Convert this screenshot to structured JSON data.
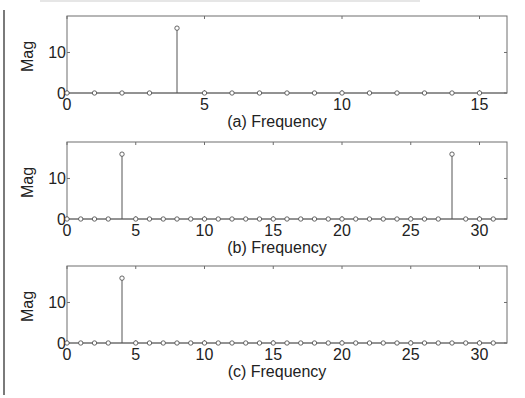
{
  "chart_data": [
    {
      "type": "stem",
      "panel": "a",
      "xlabel": "(a) Frequency",
      "ylabel": "Mag",
      "xlim": [
        0,
        16
      ],
      "ylim": [
        0,
        19
      ],
      "xticks": [
        0,
        5,
        10,
        15
      ],
      "yticks": [
        0,
        10
      ],
      "grid": false,
      "x": [
        0,
        1,
        2,
        3,
        4,
        5,
        6,
        7,
        8,
        9,
        10,
        11,
        12,
        13,
        14,
        15
      ],
      "values": [
        0,
        0,
        0,
        0,
        16,
        0,
        0,
        0,
        0,
        0,
        0,
        0,
        0,
        0,
        0,
        0
      ]
    },
    {
      "type": "stem",
      "panel": "b",
      "xlabel": "(b)  Frequency",
      "ylabel": "Mag",
      "xlim": [
        0,
        32
      ],
      "ylim": [
        0,
        19
      ],
      "xticks": [
        0,
        5,
        10,
        15,
        20,
        25,
        30
      ],
      "yticks": [
        0,
        10
      ],
      "grid": false,
      "x": [
        0,
        1,
        2,
        3,
        4,
        5,
        6,
        7,
        8,
        9,
        10,
        11,
        12,
        13,
        14,
        15,
        16,
        17,
        18,
        19,
        20,
        21,
        22,
        23,
        24,
        25,
        26,
        27,
        28,
        29,
        30,
        31
      ],
      "values": [
        0,
        0,
        0,
        0,
        16,
        0,
        0,
        0,
        0,
        0,
        0,
        0,
        0,
        0,
        0,
        0,
        0,
        0,
        0,
        0,
        0,
        0,
        0,
        0,
        0,
        0,
        0,
        0,
        16,
        0,
        0,
        0
      ]
    },
    {
      "type": "stem",
      "panel": "c",
      "xlabel": "(c)  Frequency",
      "ylabel": "Mag",
      "xlim": [
        0,
        32
      ],
      "ylim": [
        0,
        19
      ],
      "xticks": [
        0,
        5,
        10,
        15,
        20,
        25,
        30
      ],
      "yticks": [
        0,
        10
      ],
      "grid": false,
      "x": [
        0,
        1,
        2,
        3,
        4,
        5,
        6,
        7,
        8,
        9,
        10,
        11,
        12,
        13,
        14,
        15,
        16,
        17,
        18,
        19,
        20,
        21,
        22,
        23,
        24,
        25,
        26,
        27,
        28,
        29,
        30,
        31
      ],
      "values": [
        0,
        0,
        0,
        0,
        16,
        0,
        0,
        0,
        0,
        0,
        0,
        0,
        0,
        0,
        0,
        0,
        0,
        0,
        0,
        0,
        0,
        0,
        0,
        0,
        0,
        0,
        0,
        0,
        0,
        0,
        0,
        0
      ]
    }
  ],
  "style": {
    "axis_color": "#6e6e6e",
    "stem_color": "#555555",
    "text_color": "#222222"
  }
}
